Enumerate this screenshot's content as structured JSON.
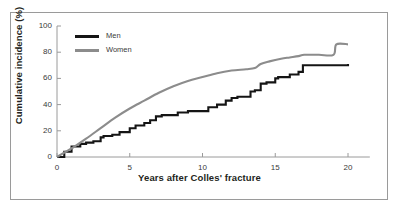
{
  "chart_data": {
    "type": "line",
    "title": "",
    "xlabel": "Years after Colles' fracture",
    "ylabel": "Cumulative incidence (%)",
    "xlim": [
      0,
      21.5
    ],
    "ylim": [
      0,
      100
    ],
    "xticks": [
      "0",
      "5",
      "10",
      "15",
      "20"
    ],
    "xtick_values": [
      0,
      5,
      10,
      15,
      20
    ],
    "yticks": [
      "0",
      "20",
      "40",
      "60",
      "80",
      "100"
    ],
    "ytick_values": [
      0,
      20,
      40,
      60,
      80,
      100
    ],
    "grid": false,
    "legend_position": "top-left-inside",
    "series": [
      {
        "name": "Men",
        "color": "#151515",
        "style": "step",
        "x": [
          0,
          0.5,
          1.0,
          1.6,
          2.0,
          2.5,
          3.0,
          3.2,
          3.8,
          4.3,
          5.0,
          5.4,
          6.0,
          6.4,
          6.8,
          7.2,
          8.0,
          8.3,
          9.0,
          10.0,
          10.4,
          11.0,
          11.6,
          12.0,
          12.4,
          13.0,
          13.3,
          13.6,
          14.0,
          14.4,
          15.0,
          15.2,
          16.0,
          16.6,
          16.9,
          18.0,
          20.0
        ],
        "y": [
          0,
          4,
          8,
          10,
          11,
          12,
          15,
          16,
          17,
          19,
          22,
          24,
          26,
          28,
          31,
          32,
          32,
          34,
          35,
          35,
          38,
          40,
          43,
          45,
          46,
          46,
          50,
          51,
          56,
          57,
          60,
          61,
          63,
          65,
          70,
          70,
          71
        ]
      },
      {
        "name": "Women",
        "color": "#8c8c8c",
        "style": "smooth-step",
        "x": [
          0,
          0.6,
          1.2,
          2.0,
          3.0,
          4.0,
          5.0,
          6.0,
          7.0,
          8.0,
          9.0,
          10.0,
          11.0,
          12.0,
          13.0,
          13.6,
          14.0,
          14.6,
          15.4,
          16.0,
          16.6,
          17.0,
          18.0,
          19.0,
          19.2,
          20.0
        ],
        "y": [
          0,
          4,
          8,
          14,
          22,
          30,
          37,
          43,
          49,
          54,
          58,
          61,
          64,
          66,
          67,
          68,
          71,
          73,
          75,
          76,
          77,
          78,
          78,
          78,
          86,
          86
        ]
      }
    ],
    "legend": [
      {
        "label": "Men",
        "color": "#151515"
      },
      {
        "label": "Women",
        "color": "#8c8c8c"
      }
    ]
  },
  "axis_colors": {
    "axis_line": "#9a9a9a",
    "frame_border": "#9a9a9a",
    "tick_text": "#3a3a3a"
  }
}
